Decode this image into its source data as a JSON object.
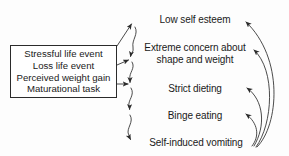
{
  "diagram": {
    "background_color": "#fdfdfd",
    "line_color": "#2b2b2b",
    "text_color": "#1a1a1a",
    "factor_box": {
      "name": "risk-factors",
      "lines": [
        "Stressful life event",
        "Loss life event",
        "Perceived weight gain",
        "Maturational task"
      ]
    },
    "stages": [
      {
        "id": "low-self-esteem",
        "label": "Low self esteem"
      },
      {
        "id": "extreme-concern",
        "label": "Extreme concern about\nshape and weight"
      },
      {
        "id": "strict-dieting",
        "label": "Strict dieting"
      },
      {
        "id": "binge-eating",
        "label": "Binge eating"
      },
      {
        "id": "self-induced-vomiting",
        "label": "Self-induced vomiting"
      }
    ],
    "connectors": [
      {
        "from": "risk-factors",
        "to": "low-self-esteem",
        "style": "straight"
      },
      {
        "from": "risk-factors",
        "to": "extreme-concern",
        "style": "straight"
      },
      {
        "from": "risk-factors",
        "to": "strict-dieting",
        "style": "straight"
      },
      {
        "from": "low-self-esteem",
        "to": "extreme-concern",
        "style": "wavy"
      },
      {
        "from": "extreme-concern",
        "to": "strict-dieting",
        "style": "wavy"
      },
      {
        "from": "strict-dieting",
        "to": "binge-eating",
        "style": "wavy"
      },
      {
        "from": "binge-eating",
        "to": "self-induced-vomiting",
        "style": "wavy"
      },
      {
        "from": "self-induced-vomiting",
        "to": "low-self-esteem",
        "style": "feedback-curve"
      },
      {
        "from": "self-induced-vomiting",
        "to": "extreme-concern",
        "style": "feedback-curve"
      },
      {
        "from": "self-induced-vomiting",
        "to": "strict-dieting",
        "style": "feedback-curve"
      },
      {
        "from": "self-induced-vomiting",
        "to": "binge-eating",
        "style": "feedback-curve"
      }
    ]
  }
}
